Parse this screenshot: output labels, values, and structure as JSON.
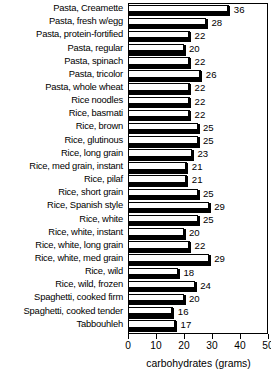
{
  "chart_data": {
    "type": "bar",
    "orientation": "horizontal",
    "title": "",
    "xlabel": "carbohydrates (grams)",
    "ylabel": "",
    "xlim": [
      0,
      50
    ],
    "xticks": [
      0,
      10,
      20,
      30,
      40,
      50
    ],
    "grid": false,
    "legend": null,
    "categories": [
      "Pasta, Creamette",
      "Pasta, fresh w/egg",
      "Pasta, protein-fortified",
      "Pasta, regular",
      "Pasta, spinach",
      "Pasta, tricolor",
      "Pasta, whole wheat",
      "Rice noodles",
      "Rice, basmati",
      "Rice, brown",
      "Rice, glutinous",
      "Rice, long grain",
      "Rice, med grain, instant",
      "Rice, pilaf",
      "Rice, short grain",
      "Rice, Spanish style",
      "Rice, white",
      "Rice, white, instant",
      "Rice, white, long grain",
      "Rice, white, med grain",
      "Rice, wild",
      "Rice, wild, frozen",
      "Spaghetti, cooked firm",
      "Spaghetti, cooked tender",
      "Tabbouhleh"
    ],
    "values": [
      36,
      28,
      22,
      20,
      22,
      26,
      22,
      22,
      22,
      25,
      25,
      23,
      21,
      21,
      25,
      29,
      25,
      20,
      22,
      29,
      18,
      24,
      20,
      16,
      17
    ],
    "value_labels": [
      "36",
      "28",
      "22",
      "20",
      "22",
      "26",
      "22",
      "22",
      "22",
      "25",
      "25",
      "23",
      "21",
      "21",
      "25",
      "29",
      "25",
      "20",
      "22",
      "29",
      "18",
      "24",
      "20",
      "16",
      "17"
    ],
    "bar_style": "3d-shadow-white-face",
    "colors": {
      "bar_face": "#ffffff",
      "bar_outline": "#000000",
      "bar_shadow": "#000000",
      "axis": "#000000",
      "text": "#000000",
      "background": "#ffffff"
    }
  }
}
